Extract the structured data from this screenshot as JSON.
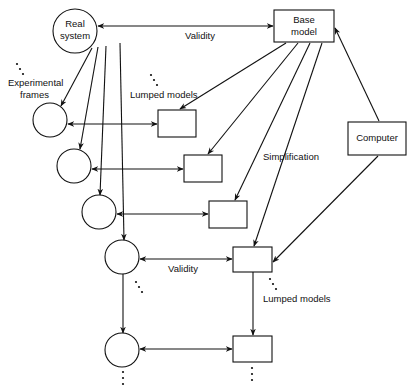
{
  "diagram": {
    "colors": {
      "stroke": "#111111",
      "background": "#ffffff"
    },
    "nodes": {
      "real_system": {
        "label_lines": [
          "Real",
          "system"
        ],
        "cx": 75,
        "cy": 31,
        "r": 22
      },
      "base_model": {
        "label_lines": [
          "Base",
          "model"
        ],
        "x": 274,
        "y": 10,
        "w": 60,
        "h": 32
      },
      "computer": {
        "label": "Computer",
        "x": 348,
        "y": 122,
        "w": 58,
        "h": 33
      },
      "frames": [
        {
          "cx": 50,
          "cy": 120,
          "r": 17
        },
        {
          "cx": 74,
          "cy": 166,
          "r": 17
        },
        {
          "cx": 99,
          "cy": 212,
          "r": 17
        },
        {
          "cx": 122,
          "cy": 257,
          "r": 17
        },
        {
          "cx": 122,
          "cy": 350,
          "r": 17
        }
      ],
      "lumped_models": [
        {
          "x": 158,
          "y": 110,
          "w": 38,
          "h": 27
        },
        {
          "x": 184,
          "y": 155,
          "w": 38,
          "h": 27
        },
        {
          "x": 209,
          "y": 201,
          "w": 38,
          "h": 27
        },
        {
          "x": 233,
          "y": 247,
          "w": 39,
          "h": 25
        },
        {
          "x": 233,
          "y": 336,
          "w": 39,
          "h": 26
        }
      ]
    },
    "labels": {
      "validity_top": "Validity",
      "validity_bottom": "Validity",
      "experimental_frames_1": "Experimental",
      "experimental_frames_2": "frames",
      "lumped_models_top": "Lumped models",
      "lumped_models_bottom": "Lumped models",
      "simplification": "Simplification"
    },
    "edges": [
      {
        "from": "real_system",
        "to": "base_model",
        "type": "bidirectional",
        "label": "Validity"
      },
      {
        "from": "real_system",
        "to": "frame_1",
        "type": "directed"
      },
      {
        "from": "real_system",
        "to": "frame_2",
        "type": "directed"
      },
      {
        "from": "real_system",
        "to": "frame_3",
        "type": "directed"
      },
      {
        "from": "real_system",
        "to": "frame_4",
        "type": "directed"
      },
      {
        "from": "frame_4",
        "to": "frame_5",
        "type": "directed"
      },
      {
        "from": "base_model",
        "to": "lumped_1",
        "type": "directed"
      },
      {
        "from": "base_model",
        "to": "lumped_2",
        "type": "directed"
      },
      {
        "from": "base_model",
        "to": "lumped_3",
        "type": "directed"
      },
      {
        "from": "base_model",
        "to": "lumped_4",
        "type": "directed",
        "label": "Simplification"
      },
      {
        "from": "lumped_4",
        "to": "lumped_5",
        "type": "directed"
      },
      {
        "from": "computer",
        "to": "base_model",
        "type": "directed"
      },
      {
        "from": "computer",
        "to": "lumped_4",
        "type": "directed"
      },
      {
        "from": "frame_1",
        "to": "lumped_1",
        "type": "bidirectional"
      },
      {
        "from": "frame_2",
        "to": "lumped_2",
        "type": "bidirectional"
      },
      {
        "from": "frame_3",
        "to": "lumped_3",
        "type": "bidirectional"
      },
      {
        "from": "frame_4",
        "to": "lumped_4",
        "type": "bidirectional",
        "label": "Validity"
      },
      {
        "from": "frame_5",
        "to": "lumped_5",
        "type": "bidirectional"
      }
    ]
  }
}
